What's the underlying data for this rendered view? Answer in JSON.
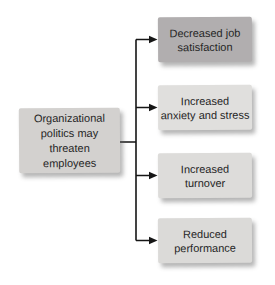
{
  "diagram": {
    "line_color": "#161616",
    "text_color": "#262626",
    "background": "#ffffff",
    "cause": {
      "label": "Organizational politics may threaten employees",
      "lines": [
        "Organizational",
        "politics may",
        "threaten",
        "employees"
      ],
      "fill": "#d3d1cf"
    },
    "effects": [
      {
        "label": "Decreased job satisfaction",
        "lines": [
          "Decreased job",
          "satisfaction"
        ],
        "fill": "#b1aeaf"
      },
      {
        "label": "Increased anxiety and stress",
        "lines": [
          "Increased",
          "anxiety and stress"
        ],
        "fill": "#e0dfdd"
      },
      {
        "label": "Increased turnover",
        "lines": [
          "Increased",
          "turnover"
        ],
        "fill": "#dddcda"
      },
      {
        "label": "Reduced performance",
        "lines": [
          "Reduced",
          "performance"
        ],
        "fill": "#dbdad8"
      }
    ]
  }
}
